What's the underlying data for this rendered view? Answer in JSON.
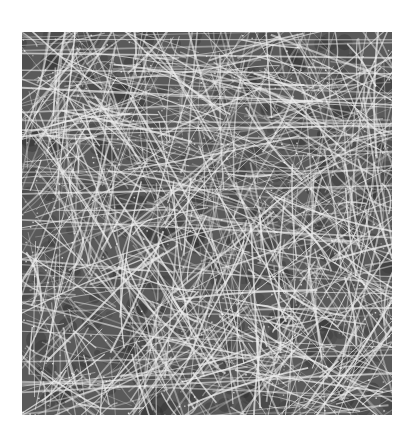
{
  "image": {
    "subject": "fibrous-network-micrograph",
    "background_color": "#5a5a5a",
    "fiber_color": "#e8e8e8",
    "region": {
      "x": 22,
      "y": 32,
      "width": 370,
      "height": 383
    },
    "fiber_count": 900,
    "seed": 17
  }
}
